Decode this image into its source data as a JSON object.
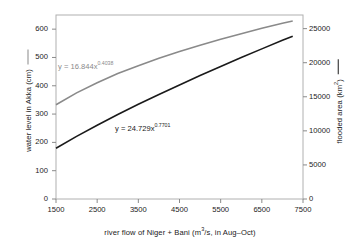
{
  "chart_data": {
    "type": "line",
    "title": "",
    "xlabel": "river flow of Niger + Bani (m3/s, in Aug–Oct)",
    "xlabel_parts": {
      "pre": "river flow of Niger + Bani (m",
      "sup": "3",
      "post": "/s, in Aug–Oct)"
    },
    "ylabel_left": "water level in Akka (cm)",
    "ylabel_right_parts": {
      "pre": "flooded area (km",
      "sup": "2",
      "post": ")"
    },
    "ylabel_right": "flooded area (km2)",
    "xlim": [
      1500,
      7500
    ],
    "ylim_left": [
      0,
      650
    ],
    "ylim_right": [
      0,
      27000
    ],
    "grid": false,
    "legend_position": "axis-titles",
    "xticks": [
      1500,
      2500,
      3500,
      4500,
      5500,
      6500,
      7500
    ],
    "xtick_labels": [
      "1500",
      "2500",
      "3500",
      "4500",
      "5500",
      "6500",
      "7500"
    ],
    "yticks_left": [
      0,
      100,
      200,
      300,
      400,
      500,
      600
    ],
    "ytick_labels_left": [
      "0",
      "100",
      "200",
      "300",
      "400",
      "500",
      "600"
    ],
    "yticks_right": [
      0,
      5000,
      10000,
      15000,
      20000,
      25000
    ],
    "ytick_labels_right": [
      "0",
      "5000",
      "10000",
      "15000",
      "20000",
      "25000"
    ],
    "series": [
      {
        "name": "water level in Akka (cm)",
        "axis": "left",
        "color": "#8a8a8a",
        "equation": "y = 16.844x",
        "equation_exponent": "0.4038",
        "coefficient": 16.844,
        "exponent": 0.4038,
        "x": [
          1500,
          2000,
          2500,
          3000,
          3500,
          4000,
          4500,
          5000,
          5500,
          6000,
          6500,
          7000,
          7250
        ],
        "values": [
          333,
          375,
          411,
          443,
          471,
          497,
          521,
          543,
          564,
          584,
          603,
          621,
          629
        ]
      },
      {
        "name": "flooded area (km2)",
        "axis": "right",
        "color": "#1a1a1a",
        "equation": "y = 24.729x",
        "equation_exponent": "0.7701",
        "coefficient": 24.729,
        "exponent": 0.7701,
        "x": [
          1500,
          2000,
          2500,
          3000,
          3500,
          4000,
          4500,
          5000,
          5500,
          6000,
          6500,
          7000,
          7250
        ],
        "values": [
          7450,
          9190,
          10830,
          12390,
          13890,
          15340,
          16740,
          18110,
          19440,
          20750,
          22030,
          23280,
          23890
        ]
      }
    ],
    "annotations": [
      {
        "text": "y = 16.844x",
        "sup": "0.4038",
        "series": "water level in Akka (cm)"
      },
      {
        "text": "y = 24.729x",
        "sup": "0.7701",
        "series": "flooded area (km2)"
      }
    ]
  },
  "colors": {
    "water_level_line": "#8a8a8a",
    "flooded_area_line": "#1a1a1a",
    "frame": "#b0b0b0",
    "text": "#1a1a1a",
    "background": "#ffffff"
  }
}
